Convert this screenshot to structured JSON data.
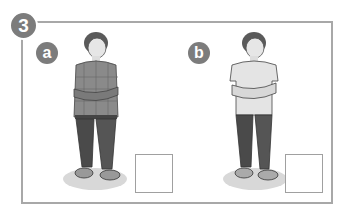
{
  "exercise": {
    "number": "3",
    "items": [
      {
        "label": "a",
        "description": "boy in checked shirt, arms crossed, jeans, sneakers",
        "answer": ""
      },
      {
        "label": "b",
        "description": "boy in plain t-shirt, arms crossed, jeans, sneakers",
        "answer": ""
      }
    ]
  },
  "colors": {
    "frame": "#a8a8a8",
    "badge": "#7c7c7c",
    "box": "#a0a0a0"
  }
}
